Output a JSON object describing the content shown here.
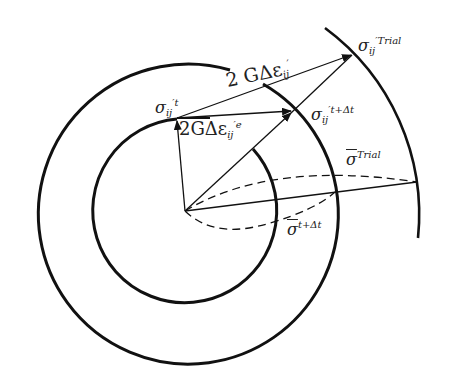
{
  "diagram": {
    "type": "yield-surface-return-mapping",
    "labels": {
      "sigma_t": {
        "base": "σ",
        "sub": "ij",
        "sup": "′t"
      },
      "sigma_t_dt": {
        "base": "σ",
        "sub": "ij",
        "sup": "′t+Δt"
      },
      "sigma_trial": {
        "base": "σ",
        "sub": "ij",
        "sup": "′Trial"
      },
      "total_increment": {
        "prefix": "2 GΔε",
        "sub": "ij",
        "sup": "′"
      },
      "elastic_increment": {
        "prefix": "2GΔε",
        "sub": "ij",
        "sup": "′e"
      },
      "sigma_bar_trial": {
        "base": "σ",
        "sup": "Trial"
      },
      "sigma_bar_t_dt": {
        "base": "σ",
        "sup": "t+Δt"
      }
    },
    "circles": [
      {
        "name": "inner-yield-surface",
        "cx": 185,
        "cy": 211,
        "r": 92
      },
      {
        "name": "outer-yield-surface",
        "cx": 185,
        "cy": 211,
        "r": 150
      },
      {
        "name": "trial-surface-arc",
        "cx": 185,
        "cy": 211,
        "r": 232
      }
    ],
    "colors": {
      "line": "#111111",
      "background": "#ffffff"
    }
  }
}
